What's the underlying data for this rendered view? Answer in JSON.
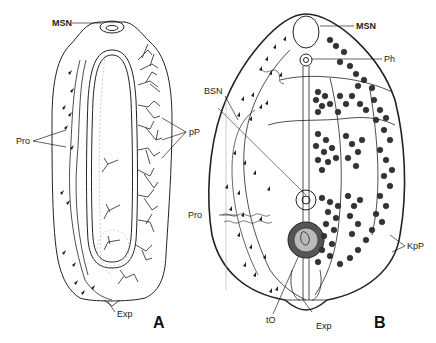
{
  "figure": {
    "panels": [
      {
        "id": "A",
        "label": "A",
        "annotations": {
          "msn": "MSN",
          "pro": "Pro",
          "pp": "pP",
          "exp": "Exp"
        }
      },
      {
        "id": "B",
        "label": "B",
        "annotations": {
          "msn": "MSN",
          "ph": "Ph",
          "bsn": "BSN",
          "pro": "Pro",
          "kpp": "KpP",
          "to": "tO",
          "exp": "Exp"
        }
      }
    ],
    "colors": {
      "ink": "#222222",
      "background": "#ffffff",
      "faint": "#999999"
    }
  }
}
